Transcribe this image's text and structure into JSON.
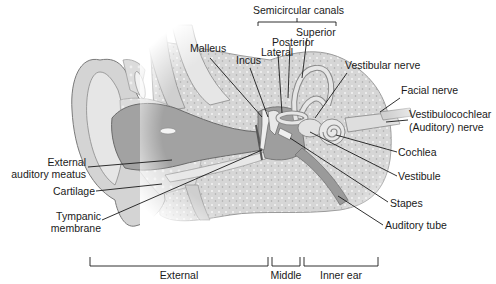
{
  "diagram": {
    "colors": {
      "background": "#ffffff",
      "skin_light": "#e4e4e4",
      "skin_mid": "#c8c8c8",
      "canal_dark": "#9a9a9a",
      "bone": "#d9d9d9",
      "bone_dots": "#f4f4f4",
      "leader_line": "#1a1a1a"
    },
    "labels": {
      "semicircular_canals": "Semicircular canals",
      "superior": "Superior",
      "posterior": "Posterior",
      "lateral": "Lateral",
      "malleus": "Malleus",
      "incus": "Incus",
      "vestibular_nerve": "Vestibular nerve",
      "facial_nerve": "Facial nerve",
      "vestibulocochlear_line1": "Vestibulocochlear",
      "vestibulocochlear_line2": "(Auditory) nerve",
      "external_auditory_meatus_line1": "External",
      "external_auditory_meatus_line2": "auditory meatus",
      "cartilage": "Cartilage",
      "tympanic_membrane_line1": "Tympanic",
      "tympanic_membrane_line2": "membrane",
      "cochlea": "Cochlea",
      "vestibule": "Vestibule",
      "stapes": "Stapes",
      "auditory_tube": "Auditory tube"
    },
    "regions": {
      "external": "External",
      "middle": "Middle",
      "inner": "Inner ear"
    }
  }
}
